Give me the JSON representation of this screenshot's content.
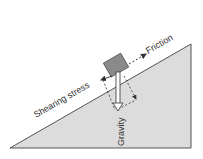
{
  "diagram": {
    "labels": {
      "friction": "Friction",
      "shearing_stress": "Shearing stress",
      "gravity": "Gravity"
    },
    "colors": {
      "slope_fill": "#dcdcdc",
      "slope_stroke": "#555555",
      "block_fill": "#8a8a8a",
      "arrow": "#333333",
      "gravity_arrow_fill": "#ffffff"
    }
  }
}
